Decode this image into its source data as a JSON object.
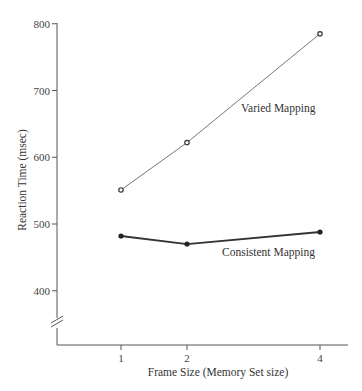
{
  "chart_data": {
    "type": "line",
    "title": "",
    "xlabel": "Frame Size (Memory Set size)",
    "ylabel": "Reaction Time (msec)",
    "x": [
      1,
      2,
      4
    ],
    "x_tick_labels": [
      "1",
      "2",
      "4"
    ],
    "y_ticks": [
      400,
      500,
      600,
      700,
      800
    ],
    "y_tick_labels": [
      "400",
      "500",
      "600",
      "700",
      "800"
    ],
    "ylim": [
      350,
      820
    ],
    "y_axis_break": true,
    "grid": false,
    "legend": "inline labels",
    "series": [
      {
        "name": "Varied Mapping",
        "marker": "open-circle",
        "line": "thin",
        "values": [
          551,
          622,
          785
        ]
      },
      {
        "name": "Consistent Mapping",
        "marker": "filled-circle",
        "line": "thick",
        "values": [
          482,
          470,
          488
        ]
      }
    ]
  }
}
